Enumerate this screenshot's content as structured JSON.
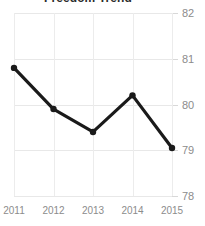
{
  "chart_data": {
    "type": "line",
    "title": "Freedom Trend",
    "xlabel": "",
    "ylabel": "",
    "categories": [
      "2011",
      "2012",
      "2013",
      "2014",
      "2015"
    ],
    "values": [
      80.8,
      79.9,
      79.4,
      80.2,
      79.05
    ],
    "series": [
      {
        "name": "Freedom Trend",
        "values": [
          80.8,
          79.9,
          79.4,
          80.2,
          79.05
        ]
      }
    ],
    "x": [
      2011,
      2012,
      2013,
      2014,
      2015
    ],
    "ylim": [
      78,
      82
    ],
    "xlim": [
      2011,
      2015
    ],
    "ytick_labels": [
      "82",
      "81",
      "80",
      "79",
      "78"
    ],
    "ytick_values": [
      82,
      81,
      80,
      79,
      78
    ],
    "xtick_labels": [
      "2011",
      "2012",
      "2013",
      "2014",
      "2015"
    ],
    "grid": true,
    "grid_x": true,
    "grid_y": true,
    "legend": false,
    "legend_position": "none",
    "markers": true,
    "y_axis_position": "right",
    "colors": {
      "line": "#1a1a1a",
      "marker": "#1a1a1a",
      "grid": "#e8e8e8",
      "tick_label": "#8c8c8c",
      "title": "#2b2b2b",
      "background": "#ffffff"
    }
  }
}
